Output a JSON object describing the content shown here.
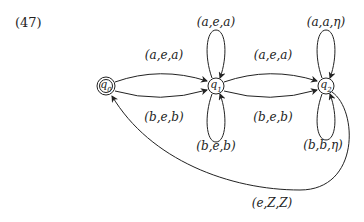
{
  "figure_number": "(47)",
  "nodes": [
    {
      "id": "q0",
      "label": "q0",
      "accepting": true
    },
    {
      "id": "q1",
      "label": "q1",
      "accepting": false
    },
    {
      "id": "q2",
      "label": "q2",
      "accepting": false
    }
  ],
  "edges": [
    {
      "from": "q0",
      "to": "q1",
      "label": "(a,e,a)",
      "position": "upper"
    },
    {
      "from": "q0",
      "to": "q1",
      "label": "(b,e,b)",
      "position": "lower"
    },
    {
      "from": "q1",
      "to": "q1",
      "label": "(a,e,a)",
      "position": "loop-top"
    },
    {
      "from": "q1",
      "to": "q1",
      "label": "(b,e,b)",
      "position": "loop-bottom"
    },
    {
      "from": "q1",
      "to": "q2",
      "label": "(a,e,a)",
      "position": "upper"
    },
    {
      "from": "q1",
      "to": "q2",
      "label": "(b,e,b)",
      "position": "lower"
    },
    {
      "from": "q2",
      "to": "q2",
      "label": "(a,a,η)",
      "position": "loop-top"
    },
    {
      "from": "q2",
      "to": "q2",
      "label": "(b,b,η)",
      "position": "loop-bottom"
    },
    {
      "from": "q2",
      "to": "q0",
      "label": "(e,Z,Z)",
      "position": "bottom-arc"
    }
  ]
}
